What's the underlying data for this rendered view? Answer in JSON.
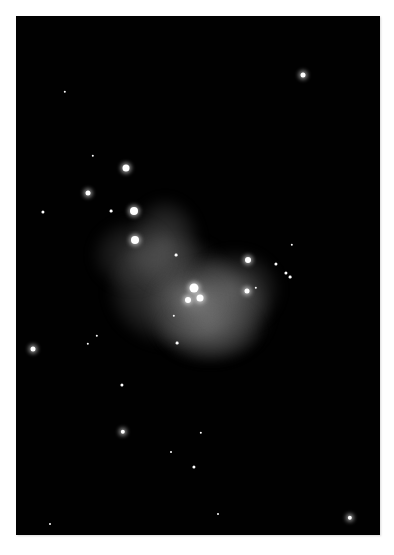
{
  "image": {
    "subject": "emission nebula star field photograph",
    "palette": {
      "sky": "#010101",
      "page": "#ffffff",
      "nebula": "#8a8a8a",
      "star": "#ffffff"
    }
  },
  "nebula": [
    {
      "x": 108,
      "y": 236,
      "w": 130,
      "h": 110,
      "opacity": 0.45
    },
    {
      "x": 130,
      "y": 198,
      "w": 70,
      "h": 90,
      "opacity": 0.4
    },
    {
      "x": 150,
      "y": 262,
      "w": 120,
      "h": 100,
      "opacity": 0.55
    },
    {
      "x": 190,
      "y": 250,
      "w": 90,
      "h": 80,
      "opacity": 0.4
    },
    {
      "x": 160,
      "y": 300,
      "w": 100,
      "h": 60,
      "opacity": 0.35
    },
    {
      "x": 92,
      "y": 220,
      "w": 80,
      "h": 70,
      "opacity": 0.3
    },
    {
      "x": 170,
      "y": 280,
      "w": 50,
      "h": 40,
      "opacity": 0.6
    }
  ],
  "stars": [
    {
      "x": 303,
      "y": 75,
      "r": 2.5,
      "glow": true
    },
    {
      "x": 65,
      "y": 92,
      "r": 1.2,
      "glow": false
    },
    {
      "x": 126,
      "y": 168,
      "r": 3.5,
      "glow": true
    },
    {
      "x": 88,
      "y": 193,
      "r": 2.5,
      "glow": true
    },
    {
      "x": 43,
      "y": 212,
      "r": 1.6,
      "glow": false
    },
    {
      "x": 111,
      "y": 211,
      "r": 1.4,
      "glow": false
    },
    {
      "x": 93,
      "y": 156,
      "r": 1.2,
      "glow": false
    },
    {
      "x": 134,
      "y": 211,
      "r": 4,
      "glow": true
    },
    {
      "x": 135,
      "y": 240,
      "r": 4,
      "glow": true
    },
    {
      "x": 176,
      "y": 255,
      "r": 1.4,
      "glow": false
    },
    {
      "x": 248,
      "y": 260,
      "r": 3,
      "glow": true
    },
    {
      "x": 276,
      "y": 264,
      "r": 1.6,
      "glow": false
    },
    {
      "x": 247,
      "y": 291,
      "r": 2.5,
      "glow": true
    },
    {
      "x": 256,
      "y": 288,
      "r": 1.2,
      "glow": false
    },
    {
      "x": 286,
      "y": 273,
      "r": 1.6,
      "glow": false
    },
    {
      "x": 290,
      "y": 277,
      "r": 1.4,
      "glow": false
    },
    {
      "x": 292,
      "y": 245,
      "r": 1.2,
      "glow": false
    },
    {
      "x": 194,
      "y": 288,
      "r": 4.5,
      "glow": true
    },
    {
      "x": 200,
      "y": 298,
      "r": 3.5,
      "glow": true
    },
    {
      "x": 188,
      "y": 300,
      "r": 3,
      "glow": true
    },
    {
      "x": 174,
      "y": 316,
      "r": 1.2,
      "glow": false
    },
    {
      "x": 177,
      "y": 343,
      "r": 1.4,
      "glow": false
    },
    {
      "x": 33,
      "y": 349,
      "r": 2.5,
      "glow": true
    },
    {
      "x": 88,
      "y": 344,
      "r": 1.2,
      "glow": false
    },
    {
      "x": 97,
      "y": 336,
      "r": 1.2,
      "glow": false
    },
    {
      "x": 122,
      "y": 385,
      "r": 1.6,
      "glow": false
    },
    {
      "x": 123,
      "y": 432,
      "r": 2.2,
      "glow": true
    },
    {
      "x": 201,
      "y": 433,
      "r": 1.2,
      "glow": false
    },
    {
      "x": 194,
      "y": 467,
      "r": 1.6,
      "glow": false
    },
    {
      "x": 171,
      "y": 452,
      "r": 1,
      "glow": false
    },
    {
      "x": 350,
      "y": 518,
      "r": 2.2,
      "glow": true
    },
    {
      "x": 218,
      "y": 514,
      "r": 1,
      "glow": false
    },
    {
      "x": 50,
      "y": 524,
      "r": 1,
      "glow": false
    }
  ]
}
